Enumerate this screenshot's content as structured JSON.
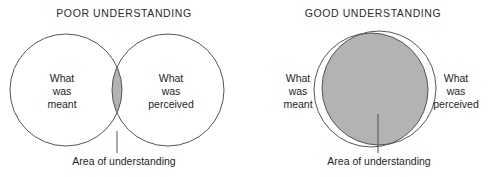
{
  "figure": {
    "caption_style": "venn-diagram-pair",
    "colors": {
      "overlap_fill": "#b3b3b3",
      "circle_stroke": "#555555",
      "pointer_line": "#555555",
      "text": "#1e1e1e",
      "background": "#ffffff"
    },
    "panels": [
      {
        "id": "poor",
        "title": "POOR UNDERSTANDING",
        "left_label": "What\nwas\nmeant",
        "left_label_lines": [
          "What",
          "was",
          "meant"
        ],
        "right_label": "What\nwas\nperceived",
        "right_label_lines": [
          "What",
          "was",
          "perceived"
        ],
        "pointer_label": "Area of understanding"
      },
      {
        "id": "good",
        "title": "GOOD UNDERSTANDING",
        "left_label": "What\nwas\nmeant",
        "left_label_lines": [
          "What",
          "was",
          "meant"
        ],
        "right_label": "What\nwas\nperceived",
        "right_label_lines": [
          "What",
          "was",
          "perceived"
        ],
        "pointer_label": "Area of understanding"
      }
    ]
  }
}
